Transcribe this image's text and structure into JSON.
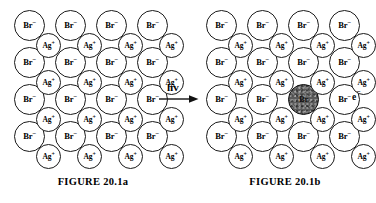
{
  "figure": {
    "topic": "silver-bromide-photolysis",
    "ion_labels": {
      "bromide_symbol": "Br",
      "bromide_charge": "−",
      "silver_symbol": "Ag",
      "silver_charge": "+",
      "bromine_atom_symbol": "Br"
    },
    "panels": [
      {
        "id": "a",
        "caption": "FIGURE 20.1a",
        "excited_ion": null
      },
      {
        "id": "b",
        "caption": "FIGURE 20.1b",
        "excited_ion": {
          "row": 3,
          "col": 3,
          "label": "Br"
        }
      }
    ],
    "arrow": {
      "label": "hv",
      "direction": "right"
    },
    "ejected_electron": {
      "symbol": "e",
      "charge": "−"
    },
    "lattice": {
      "bromide_rows": 4,
      "bromide_cols": 4,
      "silver_rows": 4,
      "silver_cols": 4,
      "bromide_positions": [
        {
          "x": 6,
          "y": 10
        },
        {
          "x": 47,
          "y": 10
        },
        {
          "x": 88,
          "y": 10
        },
        {
          "x": 129,
          "y": 10
        },
        {
          "x": 6,
          "y": 47
        },
        {
          "x": 47,
          "y": 47
        },
        {
          "x": 88,
          "y": 47
        },
        {
          "x": 129,
          "y": 47
        },
        {
          "x": 6,
          "y": 84
        },
        {
          "x": 47,
          "y": 84
        },
        {
          "x": 88,
          "y": 84
        },
        {
          "x": 129,
          "y": 84
        },
        {
          "x": 6,
          "y": 121
        },
        {
          "x": 47,
          "y": 121
        },
        {
          "x": 88,
          "y": 121
        },
        {
          "x": 129,
          "y": 121
        }
      ],
      "silver_positions": [
        {
          "x": 28,
          "y": 33
        },
        {
          "x": 69,
          "y": 33
        },
        {
          "x": 110,
          "y": 33
        },
        {
          "x": 151,
          "y": 33
        },
        {
          "x": 28,
          "y": 70
        },
        {
          "x": 69,
          "y": 70
        },
        {
          "x": 110,
          "y": 70
        },
        {
          "x": 151,
          "y": 70
        },
        {
          "x": 28,
          "y": 107
        },
        {
          "x": 69,
          "y": 107
        },
        {
          "x": 110,
          "y": 107
        },
        {
          "x": 151,
          "y": 107
        },
        {
          "x": 28,
          "y": 144
        },
        {
          "x": 69,
          "y": 144
        },
        {
          "x": 110,
          "y": 144
        },
        {
          "x": 151,
          "y": 144
        }
      ]
    },
    "colors": {
      "background": "#ffffff",
      "stroke": "#1a1a1a",
      "text": "#000000",
      "excited_fill": "#5a5a5a"
    }
  }
}
